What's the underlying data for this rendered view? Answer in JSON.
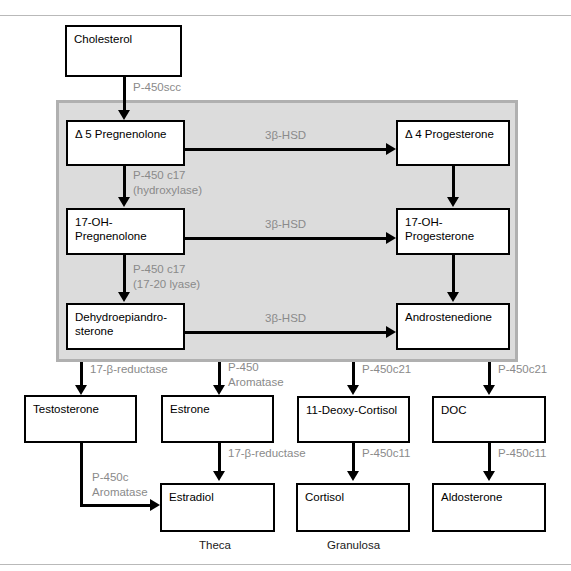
{
  "diagram": {
    "colors": {
      "panel_fill": "#dcdcdc",
      "panel_border": "#b0b0b0",
      "node_border": "#000000",
      "node_fill": "#ffffff",
      "enzyme_label": "#8a8a8a",
      "caption": "#1a1a1a"
    }
  },
  "nodes": {
    "cholesterol": "Cholesterol",
    "d5_pregnenolone": "Δ 5 Pregnenolone",
    "oh17_pregnenolone": "17-OH-Pregnenolone",
    "dhea": "Dehydroepiandro-\nsterone",
    "d4_progesterone": "Δ 4 Progesterone",
    "oh17_progesterone": "17-OH-Progesterone",
    "androstenedione": "Androstenedione",
    "testosterone": "Testosterone",
    "estrone": "Estrone",
    "deoxy_cortisol": "11-Deoxy-Cortisol",
    "doc": "DOC",
    "estradiol": "Estradiol",
    "cortisol": "Cortisol",
    "aldosterone": "Aldosterone"
  },
  "enzymes": {
    "p450scc": "P-450scc",
    "p450c17_hydroxylase": "P-450 c17\n(hydroxylase)",
    "p450c17_lyase": "P-450 c17\n(17-20 lyase)",
    "hsd3b_top": "3β-HSD",
    "hsd3b_mid": "3β-HSD",
    "hsd3b_bottom": "3β-HSD",
    "reductase17b_left": "17-β-reductase",
    "p450_aromatase": "P-450\nAromatase",
    "p450c21_left": "P-450c21",
    "p450c21_right": "P-450c21",
    "reductase17b_right": "17-β-reductase",
    "p450c_aromatase": "P-450c\nAromatase",
    "p450c11_left": "P-450c11",
    "p450c11_right": "P-450c11"
  },
  "captions": {
    "theca": "Theca",
    "granulosa": "Granulosa"
  }
}
